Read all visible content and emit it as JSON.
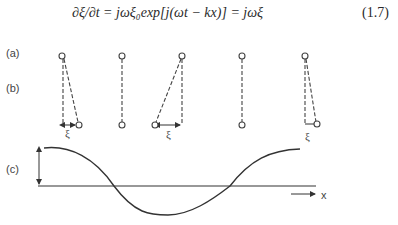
{
  "equation": {
    "text": "∂ξ/∂t = jωξ₀exp[j(ωt − kx)] = jωξ",
    "number": "(1.7)"
  },
  "figure": {
    "panel_labels": [
      "(a)",
      "(b)",
      "(c)"
    ],
    "pendulums": [
      {
        "index": 1,
        "displacement": "right",
        "label": "ξ"
      },
      {
        "index": 2,
        "displacement": "none",
        "label": ""
      },
      {
        "index": 3,
        "displacement": "left",
        "label": "ξ"
      },
      {
        "index": 4,
        "displacement": "none",
        "label": ""
      },
      {
        "index": 5,
        "displacement": "small-right",
        "label": "ξ"
      }
    ],
    "wave": {
      "axis_label": "x",
      "amplitude_arrow": true,
      "shape": "cosine, one wavelength"
    }
  }
}
